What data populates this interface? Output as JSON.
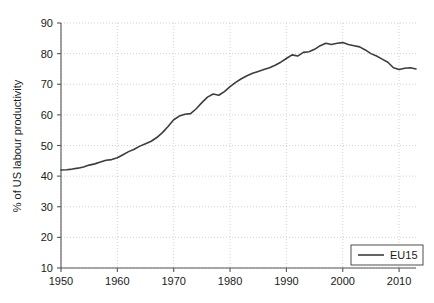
{
  "chart_data": {
    "type": "line",
    "title": "",
    "xlabel": "",
    "ylabel": "% of US labour productivity",
    "xlim": [
      1950,
      2013
    ],
    "ylim": [
      10,
      90
    ],
    "xticks": [
      1950,
      1960,
      1970,
      1980,
      1990,
      2000,
      2010
    ],
    "yticks": [
      10,
      20,
      30,
      40,
      50,
      60,
      70,
      80,
      90
    ],
    "grid": true,
    "legend_position": "lower-right",
    "legend": [
      "EU15"
    ],
    "series": [
      {
        "name": "EU15",
        "color": "#3d3d3d",
        "x": [
          1950,
          1951,
          1952,
          1953,
          1954,
          1955,
          1956,
          1957,
          1958,
          1959,
          1960,
          1961,
          1962,
          1963,
          1964,
          1965,
          1966,
          1967,
          1968,
          1969,
          1970,
          1971,
          1972,
          1973,
          1974,
          1975,
          1976,
          1977,
          1978,
          1979,
          1980,
          1981,
          1982,
          1983,
          1984,
          1985,
          1986,
          1987,
          1988,
          1989,
          1990,
          1991,
          1992,
          1993,
          1994,
          1995,
          1996,
          1997,
          1998,
          1999,
          2000,
          2001,
          2002,
          2003,
          2004,
          2005,
          2006,
          2007,
          2008,
          2009,
          2010,
          2011,
          2012,
          2013
        ],
        "y": [
          42.0,
          42.1,
          42.3,
          42.6,
          43.0,
          43.6,
          44.0,
          44.6,
          45.2,
          45.4,
          46.0,
          47.0,
          48.0,
          48.8,
          49.8,
          50.6,
          51.4,
          52.6,
          54.2,
          56.2,
          58.4,
          59.6,
          60.2,
          60.4,
          62.0,
          64.0,
          65.8,
          66.8,
          66.4,
          67.6,
          69.2,
          70.6,
          71.8,
          72.8,
          73.6,
          74.2,
          74.8,
          75.4,
          76.2,
          77.2,
          78.4,
          79.6,
          79.2,
          80.4,
          80.6,
          81.4,
          82.6,
          83.4,
          83.0,
          83.4,
          83.6,
          83.0,
          82.6,
          82.2,
          81.2,
          80.0,
          79.2,
          78.2,
          77.2,
          75.4,
          74.8,
          75.2,
          75.4,
          75.0
        ],
        "start_value": 42.0,
        "peak_value": 83.6,
        "peak_year": 2000,
        "end_value": 75.0
      }
    ]
  },
  "legend": {
    "entries": [
      {
        "label": "EU15"
      }
    ]
  },
  "axes": {
    "y_title": "% of US labour productivity",
    "y_tick_labels": [
      "90",
      "80",
      "70",
      "60",
      "50",
      "40",
      "30",
      "20",
      "10"
    ],
    "x_tick_labels": [
      "1950",
      "1960",
      "1970",
      "1980",
      "1990",
      "2000",
      "2010"
    ]
  },
  "colors": {
    "series_eu15": "#3d3d3d",
    "grid": "#c8c8c8",
    "axis": "#555555",
    "text": "#1a1a1a",
    "background": "#ffffff"
  }
}
